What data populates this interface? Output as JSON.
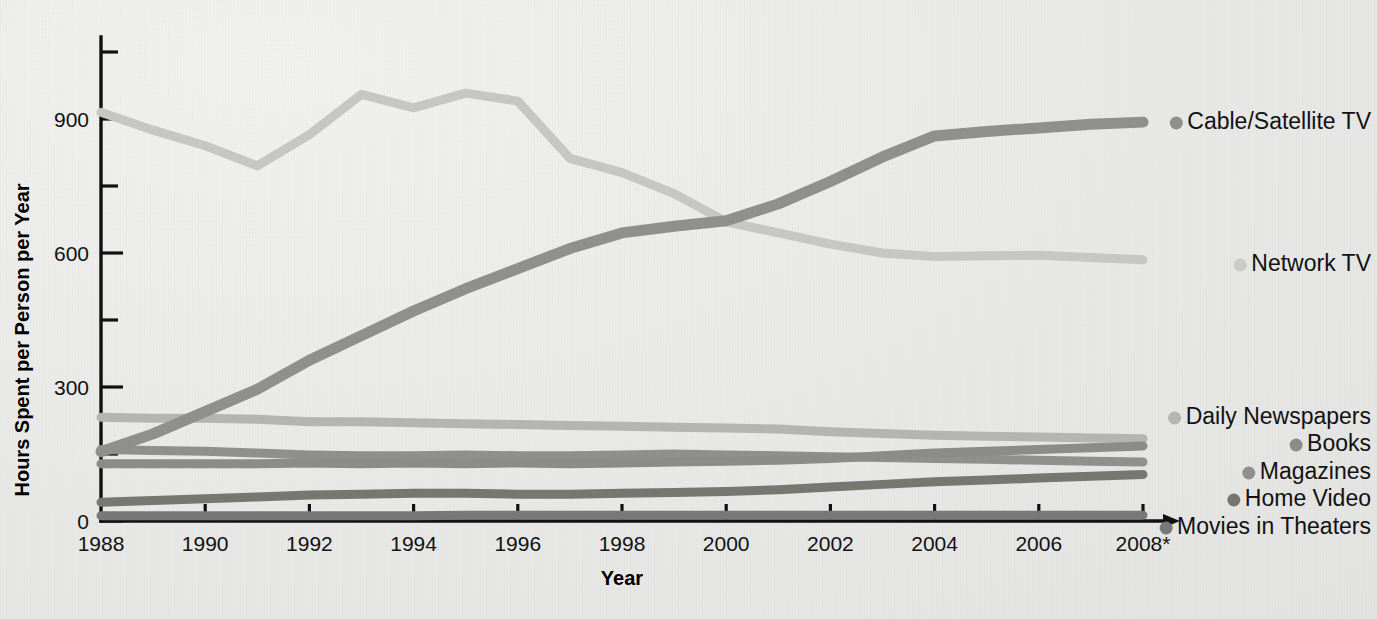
{
  "chart_data": {
    "type": "line",
    "title": "",
    "xlabel": "Year",
    "ylabel": "Hours Spent per Person per Year",
    "xlim": [
      1988,
      2008
    ],
    "ylim": [
      0,
      1050
    ],
    "yticks": [
      0,
      300,
      600,
      900
    ],
    "ytick_minor": [
      150,
      450,
      750,
      1050
    ],
    "xticks": [
      1988,
      1990,
      1992,
      1994,
      1996,
      1998,
      2000,
      2002,
      2004,
      2006,
      2008
    ],
    "xtick_labels": [
      "1988",
      "1990",
      "1992",
      "1994",
      "1996",
      "1998",
      "2000",
      "2002",
      "2004",
      "2006",
      "2008*"
    ],
    "grid": false,
    "legend_position": "right",
    "x": [
      1988,
      1989,
      1990,
      1991,
      1992,
      1993,
      1994,
      1995,
      1996,
      1997,
      1998,
      1999,
      2000,
      2001,
      2002,
      2003,
      2004,
      2005,
      2006,
      2007,
      2008
    ],
    "series": [
      {
        "name": "Network TV",
        "color": "#c6c6c4",
        "values": [
          915,
          875,
          840,
          795,
          865,
          955,
          925,
          958,
          940,
          812,
          780,
          733,
          670,
          645,
          620,
          600,
          592,
          594,
          595,
          590,
          585
        ]
      },
      {
        "name": "Cable/Satellite TV",
        "color": "#8f908e",
        "values": [
          155,
          195,
          245,
          295,
          360,
          415,
          470,
          520,
          565,
          610,
          645,
          660,
          672,
          710,
          760,
          815,
          862,
          872,
          880,
          888,
          893
        ]
      },
      {
        "name": "Daily Newspapers",
        "color": "#b4b5b2",
        "values": [
          232,
          230,
          230,
          228,
          222,
          222,
          220,
          218,
          216,
          214,
          212,
          210,
          208,
          206,
          200,
          196,
          192,
          190,
          188,
          186,
          184
        ]
      },
      {
        "name": "Books",
        "color": "#8b8c8a",
        "values": [
          128,
          128,
          128,
          128,
          130,
          128,
          130,
          128,
          130,
          128,
          130,
          132,
          134,
          136,
          140,
          146,
          152,
          156,
          160,
          164,
          168
        ]
      },
      {
        "name": "Magazines",
        "color": "#8f908e",
        "values": [
          160,
          158,
          156,
          152,
          148,
          146,
          146,
          148,
          146,
          146,
          148,
          150,
          148,
          146,
          144,
          142,
          140,
          138,
          136,
          134,
          132
        ]
      },
      {
        "name": "Home Video",
        "color": "#76776f",
        "values": [
          42,
          46,
          50,
          54,
          58,
          60,
          62,
          62,
          60,
          60,
          62,
          64,
          66,
          70,
          76,
          82,
          88,
          92,
          96,
          100,
          104
        ]
      },
      {
        "name": "Movies in Theaters",
        "color": "#77787a",
        "values": [
          12,
          12,
          12,
          12,
          12,
          12,
          12,
          13,
          13,
          13,
          13,
          13,
          13,
          13,
          13,
          13,
          13,
          13,
          13,
          13,
          13
        ]
      }
    ],
    "legend": [
      {
        "label": "Cable/Satellite TV",
        "color": "#8f908e",
        "y": 123
      },
      {
        "label": "Network TV",
        "color": "#cacac8",
        "y": 265
      },
      {
        "label": "Daily Newspapers",
        "color": "#b4b5b2",
        "y": 418
      },
      {
        "label": "Books",
        "color": "#8b8c8a",
        "y": 445
      },
      {
        "label": "Magazines",
        "color": "#8f908e",
        "y": 473
      },
      {
        "label": "Home Video",
        "color": "#76776f",
        "y": 500
      },
      {
        "label": "Movies in Theaters",
        "color": "#77787a",
        "y": 528
      }
    ]
  }
}
